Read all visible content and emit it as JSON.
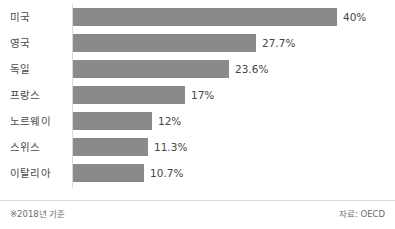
{
  "chart_data": {
    "type": "bar",
    "orientation": "horizontal",
    "title": "",
    "subtitle": "",
    "xlabel": "",
    "ylabel": "",
    "grid": false,
    "legend": null,
    "xlim": [
      0,
      40
    ],
    "categories": [
      "미국",
      "영국",
      "독일",
      "프랑스",
      "노르웨이",
      "스위스",
      "이탈리아"
    ],
    "values": [
      40,
      27.7,
      23.6,
      17,
      12,
      11.3,
      10.7
    ],
    "value_labels": [
      "40%",
      "27.7%",
      "23.6%",
      "17%",
      "12%",
      "11.3%",
      "10.7%"
    ],
    "unit": "%",
    "bars": [
      {
        "category": "미국",
        "value": 40,
        "label": "40%"
      },
      {
        "category": "영국",
        "value": 27.7,
        "label": "27.7%"
      },
      {
        "category": "독일",
        "value": 23.6,
        "label": "23.6%"
      },
      {
        "category": "프랑스",
        "value": 17,
        "label": "17%"
      },
      {
        "category": "노르웨이",
        "value": 12,
        "label": "12%"
      },
      {
        "category": "스위스",
        "value": 11.3,
        "label": "11.3%"
      },
      {
        "category": "이탈리아",
        "value": 10.7,
        "label": "10.7%"
      }
    ]
  },
  "footer": {
    "note": "※2018년 기준",
    "source": "자료: OECD"
  },
  "colors": {
    "bar_fill": "#8a8a8a",
    "category_text": "#4a4a4a",
    "value_text": "#454545",
    "footer_text": "#6b6b6b",
    "axis_line": "#d9d9d9",
    "rule": "#dcdcdc",
    "background": "#ffffff"
  }
}
